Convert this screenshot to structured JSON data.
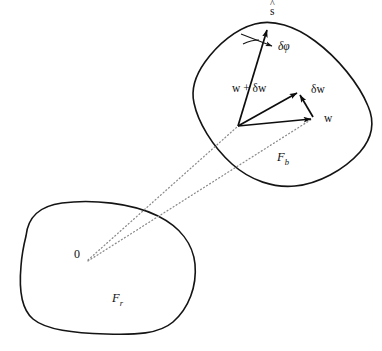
{
  "figure": {
    "background_color": "#ffffff",
    "stroke_color": "#141414",
    "dotted_color": "#8a8a8a",
    "width": 382,
    "height": 351
  },
  "bodies": [
    {
      "id": "reference-body",
      "frame_label": "F",
      "frame_subscript": "r",
      "origin_label": "0",
      "description": "lower-left rigid body outline"
    },
    {
      "id": "deformed-body",
      "frame_label": "F",
      "frame_subscript": "b",
      "description": "upper-right rotated rigid body outline"
    }
  ],
  "vectors": [
    {
      "id": "s-hat",
      "label": "s",
      "accent": "^",
      "description": "unit axis vector of rotation"
    },
    {
      "id": "w-plus-dw",
      "label": "w + δw",
      "description": "perturbed position vector"
    },
    {
      "id": "delta-w",
      "label": "δw",
      "description": "variation of w"
    },
    {
      "id": "w",
      "label": "w",
      "description": "position vector"
    },
    {
      "id": "delta-phi",
      "label": "δφ",
      "description": "infinitesimal rotation angle"
    }
  ],
  "rays": [
    {
      "id": "ray-to-vector-base",
      "style": "dotted"
    },
    {
      "id": "ray-to-w-tip",
      "style": "dotted"
    }
  ]
}
